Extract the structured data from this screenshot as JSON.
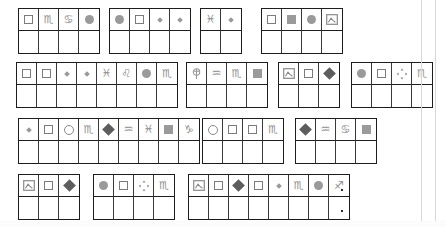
{
  "page": {
    "background_color": "#ffffff",
    "border_color": "#1d1d1d",
    "glyph_color": "#8d8d8d",
    "width": 446,
    "height": 227
  },
  "legend": {
    "square-outline": "□",
    "square-filled": "■",
    "circle-filled": "●",
    "circle-outline": "○",
    "diamond-small": "♦",
    "diamond-filled": "◆",
    "scorpio": "♏",
    "cancer": "♋",
    "pisces": "♓",
    "leo": "♌",
    "aquarius": "♒",
    "capricorn": "♑",
    "sagittarius": "♐",
    "picture": "picture-icon",
    "move": "move-icon",
    "tree": "tree-icon"
  },
  "rows": [
    {
      "index": 1,
      "top": 8,
      "groups": [
        {
          "left": 18,
          "cells": [
            "square-outline",
            "scorpio",
            "cancer",
            "circle-filled"
          ]
        },
        {
          "left": 109,
          "cells": [
            "circle-filled",
            "square-outline",
            "diamond-small",
            "diamond-small"
          ]
        },
        {
          "left": 200,
          "cells": [
            "pisces",
            "diamond-small"
          ]
        },
        {
          "left": 261,
          "cells": [
            "square-outline",
            "square-filled",
            "circle-filled",
            "picture"
          ]
        }
      ]
    },
    {
      "index": 2,
      "top": 62,
      "groups": [
        {
          "left": 16,
          "cells": [
            "square-outline",
            "square-outline",
            "diamond-small",
            "diamond-small",
            "pisces",
            "leo",
            "circle-filled",
            "scorpio"
          ]
        },
        {
          "left": 186,
          "cells": [
            "tree",
            "aquarius",
            "scorpio",
            "square-filled"
          ]
        },
        {
          "left": 278,
          "cells": [
            "picture",
            "square-outline",
            "diamond-filled"
          ]
        },
        {
          "left": 351,
          "cells": [
            "circle-filled",
            "square-outline",
            "move",
            "scorpio"
          ]
        }
      ]
    },
    {
      "index": 3,
      "top": 118,
      "groups": [
        {
          "left": 18,
          "cells": [
            "diamond-small",
            "square-outline",
            "circle-outline",
            "scorpio",
            "diamond-filled",
            "aquarius",
            "pisces",
            "square-filled",
            "capricorn"
          ]
        },
        {
          "left": 202,
          "cells": [
            "circle-outline",
            "square-outline",
            "square-outline",
            "scorpio"
          ]
        },
        {
          "left": 295,
          "cells": [
            "diamond-filled",
            "aquarius",
            "cancer",
            "square-filled"
          ]
        }
      ]
    },
    {
      "index": 4,
      "top": 174,
      "groups": [
        {
          "left": 18,
          "cells": [
            "picture",
            "square-outline",
            "diamond-filled"
          ]
        },
        {
          "left": 93,
          "cells": [
            "circle-filled",
            "square-outline",
            "move",
            "scorpio"
          ]
        },
        {
          "left": 188,
          "cells": [
            "picture",
            "square-outline",
            "diamond-filled",
            "square-outline",
            "diamond-small",
            "scorpio",
            "circle-filled",
            "sagittarius"
          ]
        }
      ]
    }
  ],
  "marks": [
    {
      "name": "dot-upper",
      "left": 341,
      "top": 189
    },
    {
      "name": "dot-lower",
      "left": 341,
      "top": 210
    }
  ],
  "edges": [
    {
      "name": "right-edge-line-1",
      "left": 421
    },
    {
      "name": "right-edge-line-2",
      "left": 435
    }
  ]
}
